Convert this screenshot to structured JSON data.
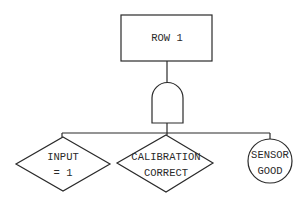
{
  "diagram": {
    "type": "fault-tree",
    "top_event": {
      "label": "ROW 1",
      "shape": "rectangle"
    },
    "gate": {
      "type": "AND",
      "shape": "and-gate"
    },
    "inputs": [
      {
        "lines": [
          "INPUT",
          "= 1"
        ],
        "shape": "diamond"
      },
      {
        "lines": [
          "CALIBRATION",
          "CORRECT"
        ],
        "shape": "diamond"
      },
      {
        "lines": [
          "SENSOR",
          "GOOD"
        ],
        "shape": "circle"
      }
    ]
  }
}
